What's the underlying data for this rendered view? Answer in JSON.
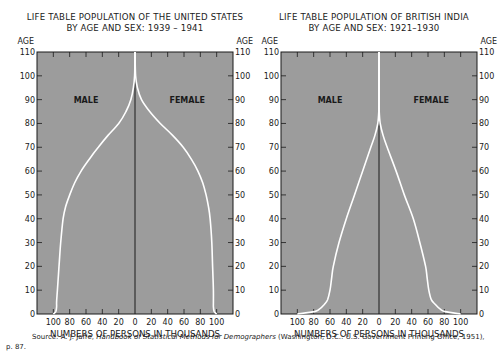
{
  "chart_data": [
    {
      "type": "area",
      "subtype": "population-pyramid",
      "title": "LIFE TABLE POPULATION OF THE UNITED STATES",
      "subtitle": "BY AGE AND SEX: 1939 – 1941",
      "xlabel": "NUMBERS OF PERSONS IN THOUSANDS",
      "ylabel": "AGE",
      "x_tick_labels": [
        "100",
        "80",
        "60",
        "40",
        "20",
        "0",
        "20",
        "40",
        "60",
        "80",
        "100"
      ],
      "y_tick_labels": [
        "0",
        "10",
        "20",
        "30",
        "40",
        "50",
        "60",
        "70",
        "80",
        "90",
        "100",
        "110"
      ],
      "xlim": [
        -120,
        120
      ],
      "ylim": [
        0,
        110
      ],
      "grid": false,
      "annotations": [
        "MALE",
        "FEMALE"
      ],
      "series": [
        {
          "name": "MALE",
          "side": "left",
          "age": [
            0,
            1,
            3,
            5,
            10,
            20,
            30,
            40,
            45,
            50,
            55,
            60,
            65,
            70,
            75,
            80,
            85,
            90,
            95,
            100,
            110
          ],
          "value": [
            100,
            97,
            96,
            96,
            95,
            93,
            91,
            88,
            85,
            80,
            74,
            66,
            56,
            45,
            33,
            20,
            11,
            5,
            2,
            0.5,
            0
          ]
        },
        {
          "name": "FEMALE",
          "side": "right",
          "age": [
            0,
            1,
            3,
            5,
            10,
            20,
            30,
            40,
            45,
            50,
            55,
            60,
            65,
            70,
            75,
            80,
            85,
            90,
            95,
            100,
            110
          ],
          "value": [
            100,
            97,
            96,
            96,
            96,
            95,
            94,
            92,
            90,
            87,
            83,
            77,
            69,
            59,
            46,
            31,
            18,
            8,
            3,
            0.7,
            0
          ]
        }
      ]
    },
    {
      "type": "area",
      "subtype": "population-pyramid",
      "title": "LIFE TABLE POPULATION OF BRITISH INDIA",
      "subtitle": "BY AGE AND SEX: 1921–1930",
      "xlabel": "NUMBERS OF PERSONS IN THOUSANDS",
      "ylabel": "AGE",
      "x_tick_labels": [
        "100",
        "80",
        "60",
        "40",
        "20",
        "0",
        "20",
        "40",
        "60",
        "80",
        "100"
      ],
      "y_tick_labels": [
        "0",
        "10",
        "20",
        "30",
        "40",
        "50",
        "60",
        "70",
        "80",
        "90",
        "100",
        "110"
      ],
      "xlim": [
        -120,
        120
      ],
      "ylim": [
        0,
        110
      ],
      "grid": false,
      "annotations": [
        "MALE",
        "FEMALE"
      ],
      "series": [
        {
          "name": "MALE",
          "side": "left",
          "age": [
            0,
            1,
            2,
            4,
            6,
            10,
            15,
            20,
            30,
            40,
            50,
            60,
            70,
            75,
            80,
            85,
            90,
            100,
            110
          ],
          "value": [
            100,
            79,
            73,
            67,
            63,
            60,
            58,
            56,
            49,
            40,
            30,
            20,
            10,
            5,
            1.5,
            0.3,
            0,
            0,
            0
          ]
        },
        {
          "name": "FEMALE",
          "side": "right",
          "age": [
            0,
            1,
            2,
            4,
            6,
            10,
            15,
            20,
            30,
            40,
            50,
            60,
            70,
            75,
            80,
            85,
            90,
            100,
            110
          ],
          "value": [
            100,
            81,
            75,
            69,
            64,
            61,
            59,
            57,
            50,
            42,
            31,
            21,
            10,
            5,
            1.5,
            0.3,
            0,
            0,
            0
          ]
        }
      ]
    }
  ],
  "charts": [
    {
      "title_line1": "LIFE TABLE POPULATION OF THE UNITED STATES",
      "title_line2": "BY AGE AND SEX: 1939 – 1941",
      "male_label": "MALE",
      "female_label": "FEMALE",
      "xlabel": "NUMBERS OF PERSONS IN THOUSANDS",
      "age_label_left": "AGE",
      "age_label_right": "AGE"
    },
    {
      "title_line1": "LIFE TABLE POPULATION OF BRITISH INDIA",
      "title_line2": "BY AGE AND SEX: 1921–1930",
      "male_label": "MALE",
      "female_label": "FEMALE",
      "xlabel": "NUMBERS OF PERSONS IN THOUSANDS",
      "age_label_left": "AGE",
      "age_label_right": "AGE"
    }
  ],
  "source": {
    "prefix": "Source: A. J. Jaffe, ",
    "book": "Handbook of Statistical Methods for Demographers",
    "suffix": " (Washington, D.C.: U.S. Government Printing Office, 1951),",
    "page": "p. 87."
  },
  "colors": {
    "plot_bg": "#9c9c9c",
    "curve": "#ffffff",
    "axis": "#1a1a1a",
    "text": "#1a1a1a"
  }
}
